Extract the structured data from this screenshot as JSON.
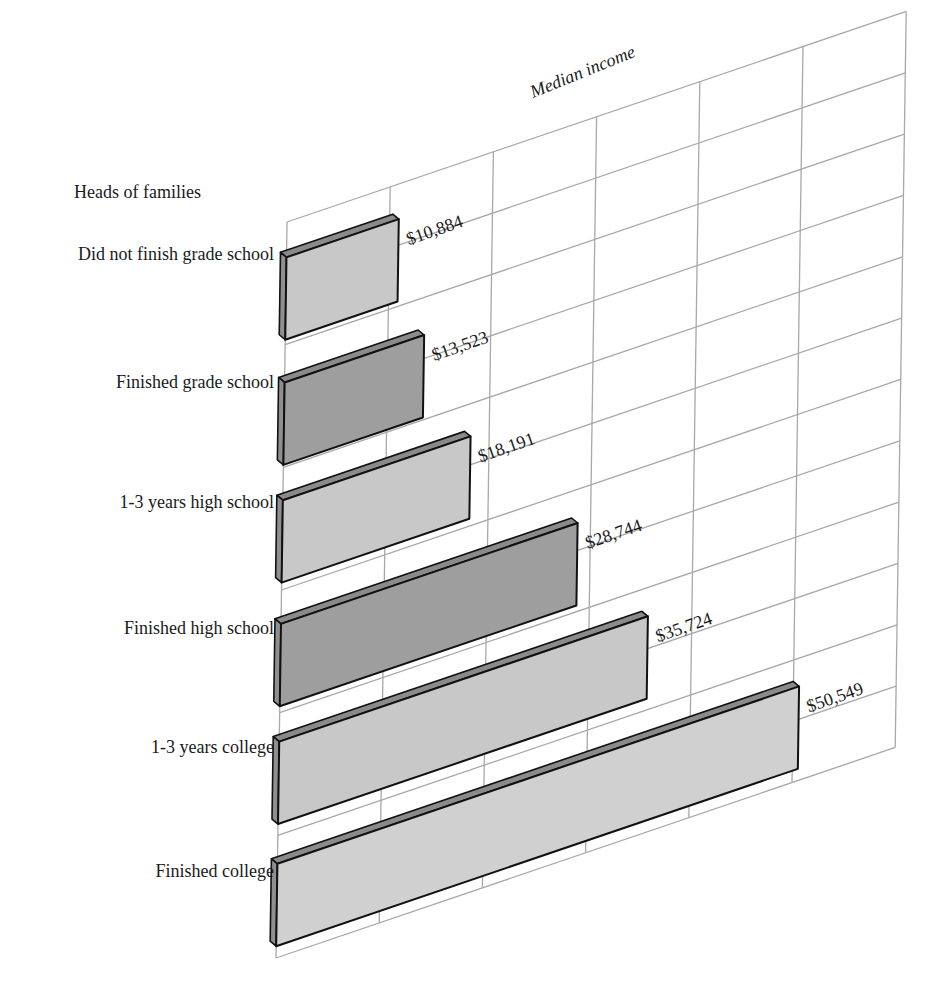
{
  "chart_data": {
    "type": "bar",
    "orientation": "horizontal",
    "style": "3d-perspective",
    "title": "Median income",
    "xlabel": "Median income",
    "ylabel": "Heads of families",
    "categories": [
      "Did not finish grade school",
      "Finished grade school",
      "1-3 years high school",
      "Finished high school",
      "1-3 years college",
      "Finished college"
    ],
    "values": [
      10884,
      13523,
      18191,
      28744,
      35724,
      50549
    ],
    "value_labels": [
      "$10,884",
      "$13,523",
      "$18,191",
      "$28,744",
      "$35,724",
      "$50,549"
    ],
    "bar_colors": [
      "#c8c8c8",
      "#9e9e9e",
      "#c8c8c8",
      "#9e9e9e",
      "#c8c8c8",
      "#d0d0d0"
    ],
    "xlim": [
      0,
      60000
    ],
    "grid": true,
    "grid_columns": 6,
    "legend": null
  },
  "labels": {
    "axis_title": "Median income",
    "row_header": "Heads of families",
    "categories": [
      "Did not finish grade school",
      "Finished grade school",
      "1-3 years high school",
      "Finished high school",
      "1-3 years college",
      "Finished college"
    ],
    "values": [
      "$10,884",
      "$13,523",
      "$18,191",
      "$28,744",
      "$35,724",
      "$50,549"
    ]
  },
  "colors": {
    "grid": "#a8a8a8",
    "bar_light": "#c8c8c8",
    "bar_dark": "#9e9e9e",
    "bar_edge": "#111111",
    "bevel": "#8a8a8a"
  }
}
